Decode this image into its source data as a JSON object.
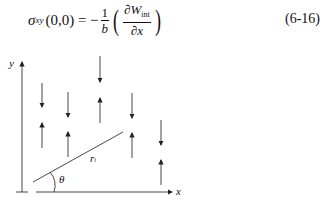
{
  "equation": {
    "lhs_symbol": "σ",
    "lhs_subscript": "xy",
    "lhs_args": "(0,0) = −",
    "coef_num": "1",
    "coef_den": "b",
    "inner_num": "∂W",
    "inner_num_sub": "int",
    "inner_den": "∂x",
    "number": "(6-16)"
  },
  "figure": {
    "x_axis_label": "x",
    "y_axis_label": "y",
    "radius_label": "r",
    "radius_sub": "i",
    "angle_label": "θ",
    "arrows": [
      {
        "x": 42,
        "y1": 83,
        "y2": 107,
        "dir": "down"
      },
      {
        "x": 42,
        "y1": 123,
        "y2": 148,
        "dir": "up"
      },
      {
        "x": 68,
        "y1": 92,
        "y2": 117,
        "dir": "down"
      },
      {
        "x": 68,
        "y1": 132,
        "y2": 157,
        "dir": "up"
      },
      {
        "x": 100,
        "y1": 56,
        "y2": 82,
        "dir": "down"
      },
      {
        "x": 100,
        "y1": 98,
        "y2": 123,
        "dir": "up"
      },
      {
        "x": 132,
        "y1": 93,
        "y2": 118,
        "dir": "down"
      },
      {
        "x": 132,
        "y1": 133,
        "y2": 158,
        "dir": "up"
      },
      {
        "x": 161,
        "y1": 120,
        "y2": 145,
        "dir": "down"
      },
      {
        "x": 161,
        "y1": 160,
        "y2": 185,
        "dir": "up"
      }
    ]
  }
}
